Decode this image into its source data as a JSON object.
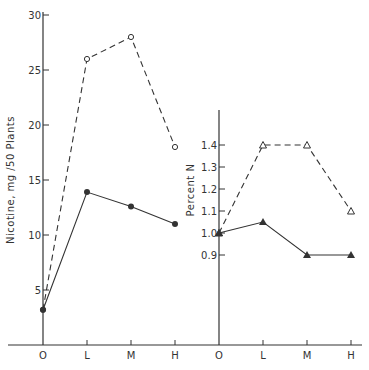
{
  "chart_data": [
    {
      "type": "line",
      "title": "",
      "xlabel": "",
      "ylabel": "Nicotine, mg /50 Plants",
      "categories": [
        "O",
        "L",
        "M",
        "H"
      ],
      "yticks": [
        "5",
        "10",
        "15",
        "20",
        "25",
        "30"
      ],
      "ylim": [
        0,
        30
      ],
      "grid": false,
      "series": [
        {
          "name": "dashed-open-circle",
          "style": "dashed",
          "marker": "open-circle",
          "values": [
            3.2,
            26,
            28,
            18
          ]
        },
        {
          "name": "solid-filled-circle",
          "style": "solid",
          "marker": "filled-circle",
          "values": [
            3.2,
            13.9,
            12.6,
            11.0
          ]
        }
      ]
    },
    {
      "type": "line",
      "title": "",
      "xlabel": "",
      "ylabel": "Percent N",
      "categories": [
        "O",
        "L",
        "M",
        "H"
      ],
      "yticks": [
        "0.9",
        "1.0",
        "1.1",
        "1.2",
        "1.3",
        "1.4"
      ],
      "ylim": [
        0.4,
        1.9
      ],
      "grid": false,
      "series": [
        {
          "name": "dashed-open-triangle",
          "style": "dashed",
          "marker": "open-triangle",
          "values": [
            1.0,
            1.4,
            1.4,
            1.1
          ]
        },
        {
          "name": "solid-filled-triangle",
          "style": "solid",
          "marker": "filled-triangle",
          "values": [
            1.0,
            1.05,
            0.9,
            0.9
          ]
        }
      ]
    }
  ],
  "colors": {
    "ink": "#333333",
    "background": "#ffffff"
  }
}
